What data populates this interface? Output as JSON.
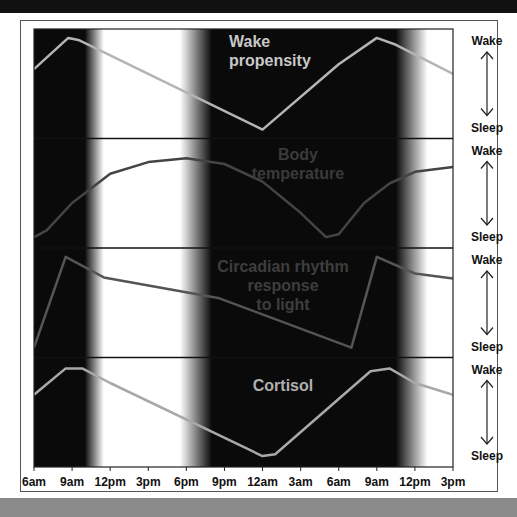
{
  "chart_data": {
    "type": "line",
    "title": "",
    "xlabel": "",
    "ylabel": "",
    "x": [
      "6am",
      "9am",
      "12pm",
      "3pm",
      "6pm",
      "9pm",
      "12am",
      "3am",
      "6am",
      "9am",
      "12pm",
      "3pm"
    ],
    "x_hours": [
      0,
      3,
      6,
      9,
      12,
      15,
      18,
      21,
      24,
      27,
      30,
      33
    ],
    "ylim": [
      0,
      1
    ],
    "y_axis_labels": {
      "top": "Wake",
      "bottom": "Sleep"
    },
    "dark_periods": [
      {
        "label": "night",
        "start_hour": -2,
        "end_hour": 4,
        "fade_hours": 1.5
      },
      {
        "label": "night",
        "start_hour": 14,
        "end_hour": 28.5,
        "fade_hours": 2.5
      }
    ],
    "series": [
      {
        "name": "Wake propensity",
        "color": "#b4b4b4",
        "points": [
          [
            0,
            0.65
          ],
          [
            2.7,
            0.97
          ],
          [
            3.5,
            0.95
          ],
          [
            18,
            0.03
          ],
          [
            24,
            0.7
          ],
          [
            27,
            0.97
          ],
          [
            28.5,
            0.9
          ],
          [
            33,
            0.6
          ]
        ]
      },
      {
        "name": "Body temperature",
        "color": "#444444",
        "points": [
          [
            0,
            0.05
          ],
          [
            1,
            0.12
          ],
          [
            3,
            0.4
          ],
          [
            6,
            0.7
          ],
          [
            9,
            0.82
          ],
          [
            12,
            0.86
          ],
          [
            15,
            0.8
          ],
          [
            18,
            0.62
          ],
          [
            21,
            0.3
          ],
          [
            23,
            0.05
          ],
          [
            24,
            0.08
          ],
          [
            26,
            0.4
          ],
          [
            28,
            0.6
          ],
          [
            30,
            0.72
          ],
          [
            33,
            0.77
          ]
        ]
      },
      {
        "name": "Circadian rhythm response to light",
        "color": "#555555",
        "points": [
          [
            0,
            0.04
          ],
          [
            2.5,
            0.97
          ],
          [
            5.5,
            0.76
          ],
          [
            14.5,
            0.55
          ],
          [
            25,
            0.04
          ],
          [
            27,
            0.97
          ],
          [
            30,
            0.8
          ],
          [
            33,
            0.75
          ]
        ]
      },
      {
        "name": "Cortisol",
        "color": "#a8a8a8",
        "points": [
          [
            0,
            0.68
          ],
          [
            2.5,
            0.95
          ],
          [
            3.8,
            0.95
          ],
          [
            6,
            0.8
          ],
          [
            18,
            0.05
          ],
          [
            19,
            0.07
          ],
          [
            26.5,
            0.92
          ],
          [
            28,
            0.95
          ],
          [
            30,
            0.8
          ],
          [
            33,
            0.68
          ]
        ]
      }
    ],
    "panel_labels": [
      {
        "lines": [
          "Wake",
          "propensity"
        ],
        "color": "#c8c8c8"
      },
      {
        "lines": [
          "Body",
          "temperature"
        ],
        "color": "#3a3a3a"
      },
      {
        "lines": [
          "Circadian rhythm",
          "response",
          "to light"
        ],
        "color": "#3e3e3e"
      },
      {
        "lines": [
          "Cortisol"
        ],
        "color": "#b0b0b0"
      }
    ]
  },
  "legend": {
    "wake": "Wake",
    "sleep": "Sleep"
  }
}
